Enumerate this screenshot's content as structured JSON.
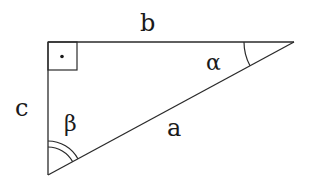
{
  "diagram": {
    "type": "right-triangle",
    "stroke_color": "#2a2a2a",
    "vertices": {
      "right_angle": [
        48,
        42
      ],
      "alpha_vertex": [
        294,
        42
      ],
      "beta_vertex": [
        48,
        175
      ]
    },
    "sides": {
      "top": "b",
      "left": "c",
      "hypotenuse": "a"
    },
    "angles": {
      "alpha": "α",
      "beta": "β",
      "right_angle_marker": "·"
    }
  }
}
